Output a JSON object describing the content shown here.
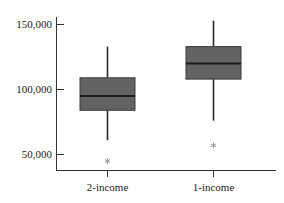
{
  "chart_data": {
    "type": "box",
    "title": "",
    "xlabel": "",
    "ylabel": "",
    "categories": [
      "2-income",
      "1-income"
    ],
    "ylim": [
      33000,
      158000
    ],
    "yticks": [
      50000,
      100000,
      150000
    ],
    "ytick_labels": [
      "50,000",
      "100,000",
      "150,000"
    ],
    "grid": false,
    "legend": null,
    "series": [
      {
        "name": "2-income",
        "whisker_low": 61000,
        "q1": 84000,
        "median": 95000,
        "q3": 109000,
        "whisker_high": 133000,
        "outliers": [
          45000
        ]
      },
      {
        "name": "1-income",
        "whisker_low": 76000,
        "q1": 108000,
        "median": 120000,
        "q3": 133000,
        "whisker_high": 153000,
        "outliers": [
          57000
        ]
      }
    ],
    "colors": {
      "box_fill": "#636363",
      "box_edge": "#3a3a3a",
      "median": "#1a1a1a",
      "whisker": "#2b2b2b",
      "outlier": "#9a9a9a",
      "axis": "#333333",
      "background": "#ffffff"
    }
  },
  "axis": {
    "y_tick_0": "50,000",
    "y_tick_1": "100,000",
    "y_tick_2": "150,000"
  },
  "xaxis": {
    "label_0": "2-income",
    "label_1": "1-income"
  }
}
